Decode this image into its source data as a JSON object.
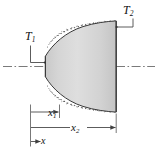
{
  "figure": {
    "kind": "heat-conduction-frustum-diagram",
    "labels": {
      "T1_base": "T",
      "T1_sub": "1",
      "T2_base": "T",
      "T2_sub": "2",
      "x1_base": "x",
      "x1_sub": "1",
      "x2_base": "x",
      "x2_sub": "2",
      "x_axis": "x"
    },
    "colors": {
      "body_fill_light": "#e9e9e9",
      "body_fill_dark": "#c6c6c6",
      "outline": "#3b3b3b",
      "line": "#4a4a4a",
      "centerline": "#6e6e6e",
      "stipple": "#5a5a5a",
      "background": "#ffffff",
      "text": "#111111"
    },
    "elements": {
      "body": "tapered-conical-solid",
      "insulation": "stippled-dots-along-curved-surfaces",
      "centerline": "horizontal-dash-dot-axis",
      "dim_x1": "dimension-arrow-to-x1",
      "dim_x2": "dimension-arrow-to-x2",
      "axis_arrow": "x-direction-arrow"
    }
  }
}
